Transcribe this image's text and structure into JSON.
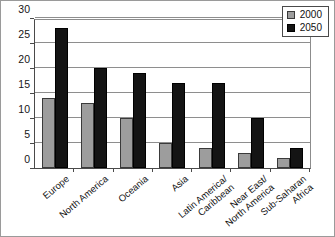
{
  "chart_data": {
    "type": "bar",
    "title": "",
    "subtitle": "",
    "xlabel": "",
    "ylabel": "",
    "ylim": [
      0,
      30
    ],
    "y_ticks": [
      0,
      5,
      10,
      15,
      20,
      25,
      30
    ],
    "grid": true,
    "legend_position": "top-right",
    "categories": [
      "Europe",
      "North America",
      "Oceania",
      "Asia",
      "Latin America/ Caribbean",
      "Near East/ North America",
      "Sub-Saharan Africa"
    ],
    "category_lines": [
      [
        "Europe",
        ""
      ],
      [
        "North America",
        ""
      ],
      [
        "Oceania",
        ""
      ],
      [
        "Asia",
        ""
      ],
      [
        "Latin America/",
        "Caribbean"
      ],
      [
        "Near East/",
        "North America"
      ],
      [
        "Sub-Saharan",
        "Africa"
      ]
    ],
    "series": [
      {
        "name": "2000",
        "color": "#9d9d9d",
        "values": [
          14,
          13,
          10,
          5,
          4,
          3,
          2
        ]
      },
      {
        "name": "2050",
        "color": "#141414",
        "values": [
          28,
          20,
          19,
          17,
          17,
          10,
          4
        ]
      }
    ]
  },
  "legend": {
    "items": [
      {
        "label": "2000",
        "swatch": "gray-square-icon"
      },
      {
        "label": "2050",
        "swatch": "black-square-icon"
      }
    ]
  }
}
